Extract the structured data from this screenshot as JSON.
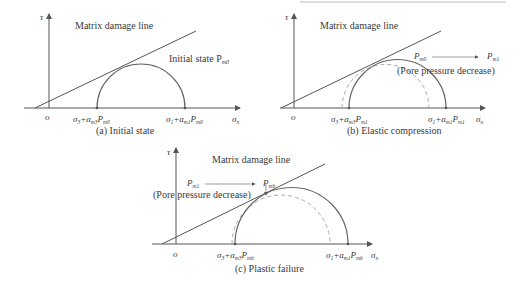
{
  "panels": [
    {
      "id": "a",
      "caption": "(a) Initial state",
      "y_axis_label": "τ",
      "x_axis_label": "σ",
      "x_axis_sub": "n",
      "origin_label": "o",
      "line_label": "Matrix damage line",
      "state_label": "Initial state P",
      "state_sub": "m0",
      "left_point": {
        "s": "σ",
        "s_sub": "3",
        "plus": "+a",
        "a_sub": "m3",
        "p": "P",
        "p_sub": "m0"
      },
      "right_point": {
        "s": "σ",
        "s_sub": "1",
        "plus": "+a",
        "a_sub": "m1",
        "p": "P",
        "p_sub": "m0"
      }
    },
    {
      "id": "b",
      "caption": "(b) Elastic compression",
      "y_axis_label": "τ",
      "x_axis_label": "σ",
      "x_axis_sub": "n",
      "origin_label": "o",
      "line_label": "Matrix damage line",
      "arrow_from": "P",
      "arrow_from_sub": "m0",
      "arrow_to": "P",
      "arrow_to_sub": "m1",
      "note": "(Pore pressure decrease)",
      "left_point": {
        "s": "σ",
        "s_sub": "3",
        "plus": "+a",
        "a_sub": "m3",
        "p": "P",
        "p_sub": "m1"
      },
      "right_point": {
        "s": "σ",
        "s_sub": "1",
        "plus": "+a",
        "a_sub": "m1",
        "p": "P",
        "p_sub": "m1"
      }
    },
    {
      "id": "c",
      "caption": "(c) Plastic failure",
      "y_axis_label": "τ",
      "x_axis_label": "σ",
      "x_axis_sub": "n",
      "origin_label": "o",
      "line_label": "Matrix damage line",
      "arrow_from": "P",
      "arrow_from_sub": "m1",
      "arrow_to": "P",
      "arrow_to_sub": "mb",
      "note": "(Pore pressure decrease)",
      "left_point": {
        "s": "σ",
        "s_sub": "3",
        "plus": "+a",
        "a_sub": "m3",
        "p": "P",
        "p_sub": "mb"
      },
      "right_point": {
        "s": "σ",
        "s_sub": "1",
        "plus": "+a",
        "a_sub": "m1",
        "p": "P",
        "p_sub": "mb"
      }
    }
  ],
  "colors": {
    "line": "#555555",
    "dashed": "#aaaaaa",
    "text": "#3a3a3a"
  }
}
